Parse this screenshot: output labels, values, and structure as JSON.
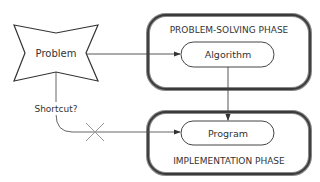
{
  "diagram": {
    "start_node": {
      "label": "Problem",
      "shape": "four-point-star"
    },
    "phases": [
      {
        "id": "problem-solving",
        "title": "PROBLEM-SOLVING PHASE",
        "step": "Algorithm"
      },
      {
        "id": "implementation",
        "title": "IMPLEMENTATION PHASE",
        "step": "Program"
      }
    ],
    "shortcut": {
      "label": "Shortcut?",
      "marker": "cross-icon"
    },
    "edges": [
      {
        "from": "Problem",
        "to": "Algorithm"
      },
      {
        "from": "Algorithm",
        "to": "Program"
      },
      {
        "from": "Problem",
        "to": "Program",
        "label": "Shortcut?",
        "crossed_out": true
      }
    ],
    "colors": {
      "stroke": "#444444",
      "box_border": "#3a3a3a",
      "text": "#333333",
      "cross": "#999999"
    }
  }
}
